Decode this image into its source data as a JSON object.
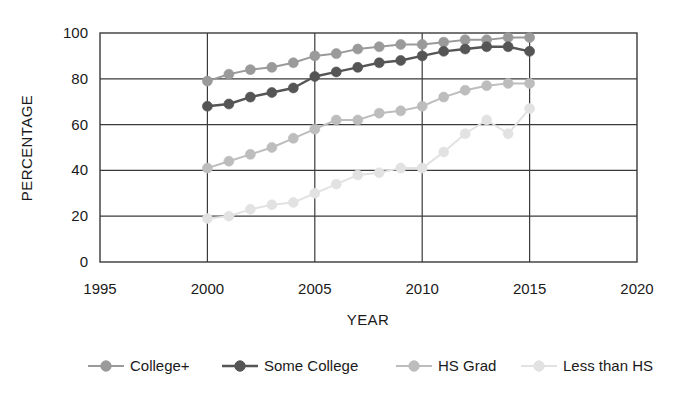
{
  "chart_data": {
    "type": "line",
    "title": "",
    "xlabel": "YEAR",
    "ylabel": "PERCENTAGE",
    "xlim": [
      1995,
      2020
    ],
    "ylim": [
      0,
      100
    ],
    "xticks": [
      1995,
      2000,
      2005,
      2010,
      2015,
      2020
    ],
    "yticks": [
      0,
      20,
      40,
      60,
      80,
      100
    ],
    "grid": true,
    "legend_position": "bottom",
    "x": [
      2000,
      2001,
      2002,
      2003,
      2004,
      2005,
      2006,
      2007,
      2008,
      2009,
      2010,
      2011,
      2012,
      2013,
      2014,
      2015
    ],
    "series": [
      {
        "name": "College+",
        "color": "#9a9a9a",
        "marker": "circle",
        "values": [
          79,
          82,
          84,
          85,
          87,
          90,
          91,
          93,
          94,
          95,
          95,
          96,
          97,
          97,
          98,
          98
        ]
      },
      {
        "name": "Some College",
        "color": "#555555",
        "marker": "circle",
        "values": [
          68,
          69,
          72,
          74,
          76,
          81,
          83,
          85,
          87,
          88,
          90,
          92,
          93,
          94,
          94,
          92
        ]
      },
      {
        "name": "HS Grad",
        "color": "#bdbdbd",
        "marker": "circle",
        "values": [
          41,
          44,
          47,
          50,
          54,
          58,
          62,
          62,
          65,
          66,
          68,
          72,
          75,
          77,
          78,
          78
        ]
      },
      {
        "name": "Less than HS",
        "color": "#e2e2e2",
        "marker": "circle",
        "values": [
          19,
          20,
          23,
          25,
          26,
          30,
          34,
          38,
          39,
          41,
          41,
          48,
          56,
          62,
          56,
          67
        ]
      }
    ]
  },
  "axes": {
    "y_title": "PERCENTAGE",
    "x_title": "YEAR",
    "x_tick_labels": [
      "1995",
      "2000",
      "2005",
      "2010",
      "2015",
      "2020"
    ],
    "y_tick_labels": [
      "0",
      "20",
      "40",
      "60",
      "80",
      "100"
    ]
  },
  "legend": {
    "items": [
      {
        "label": "College+"
      },
      {
        "label": "Some College"
      },
      {
        "label": "HS Grad"
      },
      {
        "label": "Less than HS"
      }
    ]
  }
}
